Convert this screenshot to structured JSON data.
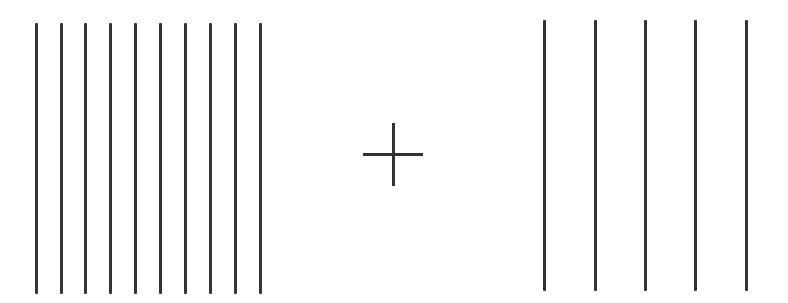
{
  "figure": {
    "background_color": "#ffffff",
    "line_color": "#333333"
  },
  "left_grating": {
    "line_count": 10,
    "x_positions": [
      36,
      61,
      85,
      110,
      135,
      160,
      185,
      210,
      235,
      260
    ],
    "y_top": 23,
    "y_bottom": 294,
    "line_width": 3,
    "spacing": 25
  },
  "fixation_cross": {
    "icon": "plus-icon",
    "center_x": 393,
    "center_y": 154,
    "h_x1": 363,
    "h_x2": 423,
    "v_y1": 123,
    "v_y2": 186,
    "stroke_width": 3
  },
  "right_grating": {
    "line_count": 5,
    "x_positions": [
      544,
      595,
      645,
      695,
      746
    ],
    "y_top": 20,
    "y_bottom": 291,
    "line_width": 3,
    "spacing": 50
  }
}
